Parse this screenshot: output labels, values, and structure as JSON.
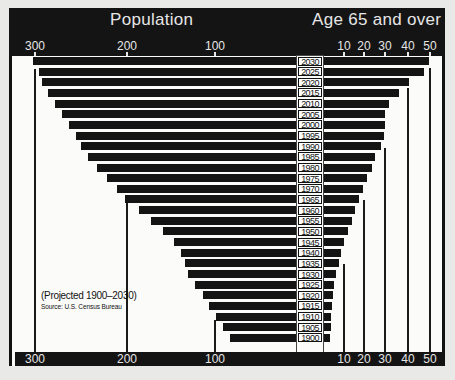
{
  "header": {
    "left_title": "Population",
    "right_title": "Age 65 and over"
  },
  "note": {
    "subtitle": "(Projected 1900–2030)",
    "source": "Source: U.S. Census Bureau"
  },
  "axes": {
    "left_ticks": [
      "300",
      "200",
      "100"
    ],
    "right_ticks": [
      "10",
      "20",
      "30",
      "40",
      "50"
    ]
  },
  "colors": {
    "bar": "#141414",
    "background": "#fbfbf9",
    "header": "#141414",
    "header_text": "#e6e6e6"
  },
  "chart_data": {
    "type": "bar",
    "subtitle": "(Projected 1900–2030)",
    "source": "Source: U.S. Census Bureau",
    "orientation": "horizontal-back-to-back",
    "categories": [
      "2030",
      "2025",
      "2020",
      "2015",
      "2010",
      "2005",
      "2000",
      "1995",
      "1990",
      "1985",
      "1980",
      "1975",
      "1970",
      "1965",
      "1960",
      "1955",
      "1950",
      "1945",
      "1940",
      "1935",
      "1930",
      "1925",
      "1920",
      "1915",
      "1910",
      "1905",
      "1900"
    ],
    "series": [
      {
        "name": "Population (millions)",
        "axis": "left",
        "values": [
          301,
          294,
          290,
          283,
          275,
          268,
          260,
          252,
          246,
          238,
          227,
          216,
          205,
          195,
          180,
          166,
          152,
          140,
          132,
          127,
          123,
          115,
          106,
          99,
          92,
          83,
          76
        ]
      },
      {
        "name": "Age 65 and over (millions)",
        "axis": "right",
        "values": [
          49.7,
          47,
          40.3,
          35.6,
          31,
          29,
          29,
          28.6,
          27,
          24.4,
          23,
          20.7,
          18.8,
          17,
          15,
          13.6,
          11.7,
          9.9,
          8.5,
          7.5,
          6.1,
          5.2,
          4.7,
          4.2,
          3.8,
          3.8,
          3.1
        ]
      }
    ],
    "left_axis": {
      "label": "Population",
      "ticks": [
        300,
        200,
        100
      ],
      "range": [
        0,
        310
      ]
    },
    "right_axis": {
      "label": "Age 65 and over",
      "ticks": [
        10,
        20,
        30,
        40,
        50
      ],
      "range": [
        0,
        52
      ]
    },
    "grid": false,
    "legend": "none"
  }
}
